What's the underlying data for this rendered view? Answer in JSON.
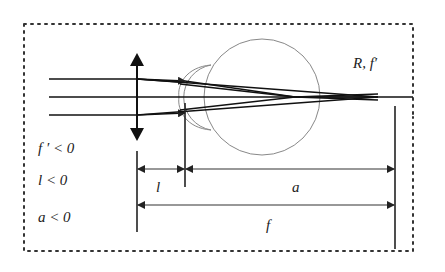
{
  "diagram": {
    "labels": {
      "eye_label": "R, f′",
      "cond_f": "f ′ < 0",
      "cond_l": "l < 0",
      "cond_a": "a < 0",
      "dim_l": "l",
      "dim_a": "a",
      "dim_f": "f"
    },
    "colors": {
      "stroke": "#111111",
      "eye_outline": "#888888",
      "dim_line": "#333333",
      "border": "#333333"
    }
  }
}
